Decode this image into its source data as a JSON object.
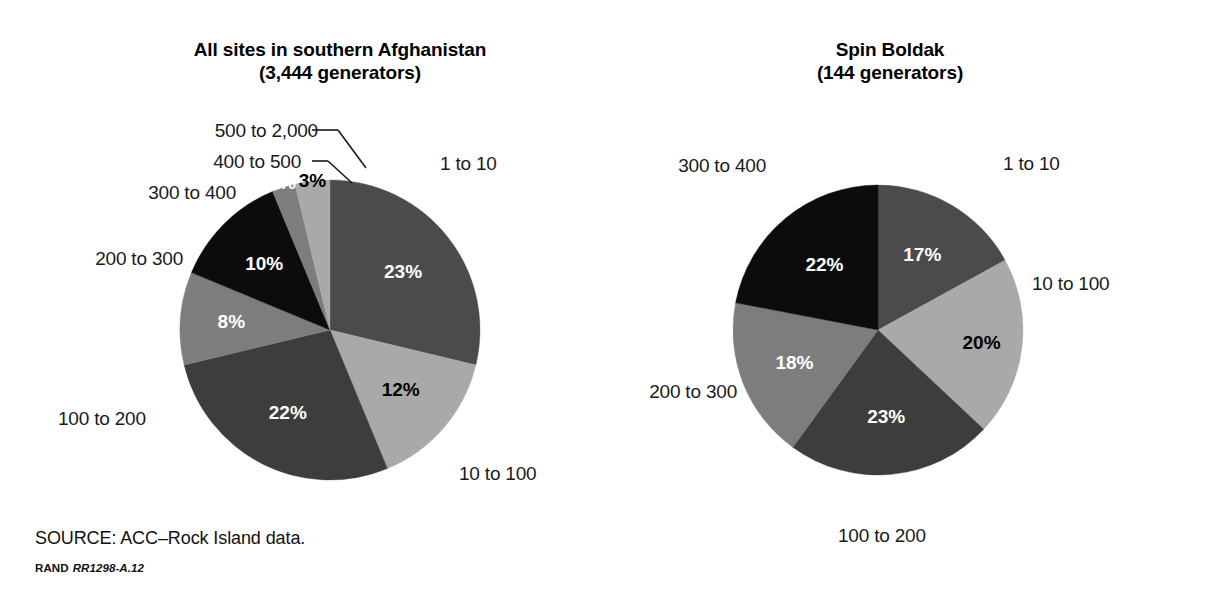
{
  "figure": {
    "source_note": "SOURCE: ACC–Rock Island data.",
    "rand_label": "RAND",
    "rand_number": "RR1298-A.12"
  },
  "colors": {
    "dark_gray": "#4b4b4b",
    "darker_gray": "#3d3d3d",
    "medium_gray": "#7d7d7d",
    "light_gray": "#a9a9a9",
    "black": "#0c0c0c",
    "label_dark": "#ffffff",
    "label_light": "#000000"
  },
  "chart_data": [
    {
      "type": "pie",
      "id": "all-sites",
      "title": "All sites in southern Afghanistan",
      "subtitle": "(3,444 generators)",
      "total_label": "3,444 generators",
      "categories": [
        "1 to 10",
        "10 to 100",
        "100 to 200",
        "200 to 300",
        "300 to 400",
        "400 to 500",
        "500 to 2,000"
      ],
      "values": [
        23,
        12,
        22,
        8,
        10,
        2,
        3
      ],
      "value_labels": [
        "23%",
        "12%",
        "22%",
        "8%",
        "10%",
        "2%",
        "3%"
      ],
      "slice_colors": [
        "#4b4b4b",
        "#a9a9a9",
        "#3d3d3d",
        "#7d7d7d",
        "#0c0c0c",
        "#7d7d7d",
        "#a9a9a9"
      ],
      "label_text_colors": [
        "#ffffff",
        "#000000",
        "#ffffff",
        "#ffffff",
        "#ffffff",
        "#ffffff",
        "#000000"
      ],
      "legend": "inline-callouts",
      "units": "percent of generators"
    },
    {
      "type": "pie",
      "id": "spin-boldak",
      "title": "Spin Boldak",
      "subtitle": "(144 generators)",
      "total_label": "144 generators",
      "categories": [
        "1 to 10",
        "10 to 100",
        "100 to 200",
        "200 to 300",
        "300 to 400"
      ],
      "values": [
        17,
        20,
        23,
        18,
        22
      ],
      "value_labels": [
        "17%",
        "20%",
        "23%",
        "18%",
        "22%"
      ],
      "slice_colors": [
        "#4b4b4b",
        "#a9a9a9",
        "#3d3d3d",
        "#7d7d7d",
        "#0c0c0c"
      ],
      "label_text_colors": [
        "#ffffff",
        "#000000",
        "#ffffff",
        "#ffffff",
        "#ffffff"
      ],
      "legend": "inline-callouts",
      "units": "percent of generators"
    }
  ],
  "left_chart": {
    "title_line1": "All sites in southern Afghanistan",
    "title_line2": "(3,444 generators)",
    "callouts": [
      {
        "label": "500 to 2,000",
        "value": "3%"
      },
      {
        "label": "400 to 500",
        "value": "2%"
      },
      {
        "label": "300 to 400",
        "value": "10%"
      },
      {
        "label": "200 to 300",
        "value": "8%"
      },
      {
        "label": "100 to 200",
        "value": "22%"
      },
      {
        "label": "10 to 100",
        "value": "12%"
      },
      {
        "label": "1 to 10",
        "value": "23%"
      }
    ]
  },
  "right_chart": {
    "title_line1": "Spin Boldak",
    "title_line2": "(144 generators)",
    "callouts": [
      {
        "label": "1 to 10",
        "value": "17%"
      },
      {
        "label": "10 to 100",
        "value": "20%"
      },
      {
        "label": "100 to 200",
        "value": "23%"
      },
      {
        "label": "200 to 300",
        "value": "18%"
      },
      {
        "label": "300 to 400",
        "value": "22%"
      }
    ]
  }
}
